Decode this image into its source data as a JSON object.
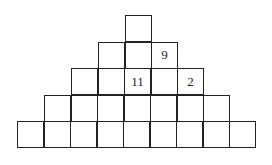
{
  "puzzle": {
    "type": "number-pyramid",
    "rows": [
      {
        "cells": [
          ""
        ]
      },
      {
        "cells": [
          "",
          "",
          "9"
        ]
      },
      {
        "cells": [
          "",
          "",
          "11",
          "",
          "2"
        ]
      },
      {
        "cells": [
          "",
          "",
          "",
          "",
          "",
          "",
          ""
        ]
      },
      {
        "cells": [
          "",
          "",
          "",
          "",
          "",
          "",
          "",
          "",
          ""
        ]
      }
    ]
  },
  "layout": {
    "cell_size": 27,
    "center_x": 138.5,
    "top_y": 15,
    "line_color": "#222222"
  }
}
